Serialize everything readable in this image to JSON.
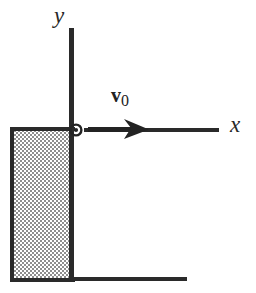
{
  "figure": {
    "type": "physics-free-body-diagram",
    "background_color": "#ffffff",
    "ink_color": "#222222",
    "hatch_color": "#8c8c8c",
    "labels": {
      "y_axis": "y",
      "x_axis": "x",
      "velocity_symbol": "v",
      "velocity_subscript": "0"
    },
    "elements": {
      "y_axis_name": "y-axis",
      "x_axis_name": "x-axis",
      "origin_marker_name": "origin-point-marker",
      "velocity_arrow_name": "velocity-vector-arrow",
      "block_name": "hatched-block",
      "ground_name": "ground-line"
    },
    "geometry": {
      "origin_x": 74,
      "origin_y": 131,
      "y_axis_top": 28,
      "y_axis_bottom": 281,
      "x_axis_left": 84,
      "x_axis_right": 219,
      "block_left": 10,
      "block_top": 128,
      "block_right": 74,
      "block_bottom": 281,
      "ground_right": 187,
      "arrow_tail_x": 88,
      "arrow_tip_x": 148
    }
  }
}
